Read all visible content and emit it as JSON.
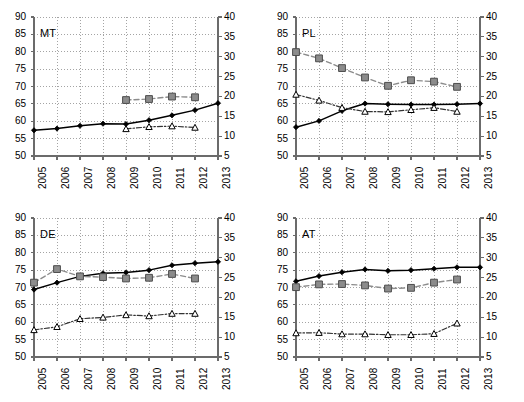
{
  "figure": {
    "type": "multi-panel-line-chart",
    "panel_count": 4,
    "layout": "2x2"
  },
  "axes": {
    "left_ticks": [
      50,
      55,
      60,
      65,
      70,
      75,
      80,
      85,
      90
    ],
    "right_ticks": [
      5,
      10,
      15,
      20,
      25,
      30,
      35,
      40
    ],
    "left_min": 50,
    "left_max": 90,
    "right_min": 5,
    "right_max": 40,
    "x_ticks": [
      "2005",
      "2006",
      "2007",
      "2008",
      "2009",
      "2010",
      "2011",
      "2012",
      "2013"
    ],
    "x_min": 2005,
    "x_max": 2013
  },
  "style": {
    "series1_color": "#000000",
    "series2_color": "#8c8c8c",
    "series3_color": "#333333",
    "grid_color": "#9a9a9a",
    "axis_color": "#6b6b6b",
    "background": "#ffffff"
  },
  "chart_data": [
    {
      "type": "line",
      "title": "MT",
      "xlabel": "",
      "ylabel": "",
      "ylim": [
        50,
        90
      ],
      "y2lim": [
        5,
        40
      ],
      "grid": true,
      "legend": "none",
      "x": [
        2005,
        2006,
        2007,
        2008,
        2009,
        2010,
        2011,
        2012,
        2013
      ],
      "series": [
        {
          "name": "solid-diamond",
          "axis": "left",
          "marker": "diamond",
          "line": "solid",
          "x": [
            2005,
            2006,
            2007,
            2008,
            2009,
            2010,
            2011,
            2012,
            2013
          ],
          "values": [
            57.4,
            57.9,
            58.7,
            59.3,
            59.2,
            60.3,
            61.7,
            63.2,
            65.2
          ]
        },
        {
          "name": "dashed-square",
          "axis": "left",
          "marker": "square",
          "line": "dashed",
          "x": [
            2009,
            2010,
            2011,
            2012
          ],
          "values": [
            66.1,
            66.4,
            67.1,
            66.9
          ]
        },
        {
          "name": "dashdot-triangle",
          "axis": "left",
          "marker": "triangle",
          "line": "dashdot",
          "x": [
            2009,
            2010,
            2011,
            2012
          ],
          "values": [
            57.8,
            58.4,
            58.6,
            58.2
          ]
        }
      ]
    },
    {
      "type": "line",
      "title": "PL",
      "xlabel": "",
      "ylabel": "",
      "ylim": [
        50,
        90
      ],
      "y2lim": [
        5,
        40
      ],
      "grid": true,
      "legend": "none",
      "x": [
        2005,
        2006,
        2007,
        2008,
        2009,
        2010,
        2011,
        2012,
        2013
      ],
      "series": [
        {
          "name": "solid-diamond",
          "axis": "left",
          "marker": "diamond",
          "line": "solid",
          "x": [
            2005,
            2006,
            2007,
            2008,
            2009,
            2010,
            2011,
            2012,
            2013
          ],
          "values": [
            58.3,
            60.1,
            63.0,
            65.1,
            64.9,
            64.8,
            64.8,
            64.9,
            65.1
          ]
        },
        {
          "name": "dashed-square",
          "axis": "left",
          "marker": "square",
          "line": "dashed",
          "x": [
            2005,
            2006,
            2007,
            2008,
            2009,
            2010,
            2011,
            2012
          ],
          "values": [
            79.9,
            78.1,
            75.3,
            72.6,
            70.2,
            71.8,
            71.4,
            69.9
          ]
        },
        {
          "name": "dashdot-triangle",
          "axis": "left",
          "marker": "triangle",
          "line": "dashdot",
          "x": [
            2005,
            2006,
            2007,
            2008,
            2009,
            2010,
            2011,
            2012
          ],
          "values": [
            67.7,
            66.0,
            63.9,
            62.8,
            62.7,
            63.3,
            63.9,
            62.8
          ]
        }
      ]
    },
    {
      "type": "line",
      "title": "DE",
      "xlabel": "",
      "ylabel": "",
      "ylim": [
        50,
        90
      ],
      "y2lim": [
        5,
        40
      ],
      "grid": true,
      "legend": "none",
      "x": [
        2005,
        2006,
        2007,
        2008,
        2009,
        2010,
        2011,
        2012,
        2013
      ],
      "series": [
        {
          "name": "solid-diamond",
          "axis": "left",
          "marker": "diamond",
          "line": "solid",
          "x": [
            2005,
            2006,
            2007,
            2008,
            2009,
            2010,
            2011,
            2012,
            2013
          ],
          "values": [
            69.4,
            71.4,
            73.2,
            74.1,
            74.3,
            75.0,
            76.4,
            77.0,
            77.4
          ]
        },
        {
          "name": "dashed-square",
          "axis": "left",
          "marker": "square",
          "line": "dashed",
          "x": [
            2005,
            2006,
            2007,
            2008,
            2009,
            2010,
            2011,
            2012
          ],
          "values": [
            71.4,
            75.3,
            73.2,
            73.0,
            72.6,
            72.8,
            73.9,
            72.6
          ]
        },
        {
          "name": "dashdot-triangle",
          "axis": "left",
          "marker": "triangle",
          "line": "dashdot",
          "x": [
            2005,
            2006,
            2007,
            2008,
            2009,
            2010,
            2011,
            2012
          ],
          "values": [
            57.8,
            58.7,
            61.0,
            61.4,
            62.1,
            61.8,
            62.5,
            62.5
          ]
        }
      ]
    },
    {
      "type": "line",
      "title": "AT",
      "xlabel": "",
      "ylabel": "",
      "ylim": [
        50,
        90
      ],
      "y2lim": [
        5,
        40
      ],
      "grid": true,
      "legend": "none",
      "x": [
        2005,
        2006,
        2007,
        2008,
        2009,
        2010,
        2011,
        2012,
        2013
      ],
      "series": [
        {
          "name": "solid-diamond",
          "axis": "left",
          "marker": "diamond",
          "line": "solid",
          "x": [
            2005,
            2006,
            2007,
            2008,
            2009,
            2010,
            2011,
            2012,
            2013
          ],
          "values": [
            71.8,
            73.3,
            74.4,
            75.2,
            74.8,
            75.0,
            75.4,
            75.8,
            75.8
          ]
        },
        {
          "name": "dashed-square",
          "axis": "left",
          "marker": "square",
          "line": "dashed",
          "x": [
            2005,
            2006,
            2007,
            2008,
            2009,
            2010,
            2011,
            2012
          ],
          "values": [
            70.1,
            70.9,
            71.0,
            70.6,
            69.7,
            69.9,
            71.4,
            72.3
          ]
        },
        {
          "name": "dashdot-triangle",
          "axis": "left",
          "marker": "triangle",
          "line": "dashdot",
          "x": [
            2005,
            2006,
            2007,
            2008,
            2009,
            2010,
            2011,
            2012
          ],
          "values": [
            56.9,
            57.0,
            56.6,
            56.6,
            56.4,
            56.4,
            56.7,
            59.7
          ]
        }
      ]
    }
  ]
}
